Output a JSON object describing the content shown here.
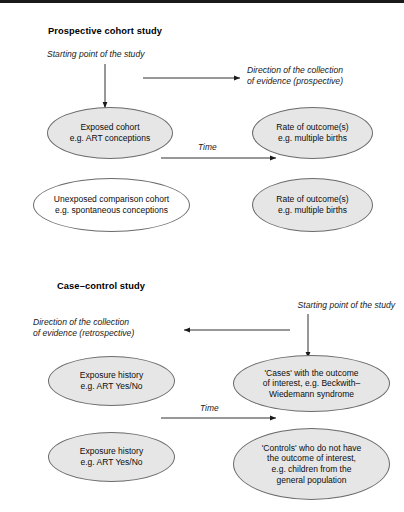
{
  "figure": {
    "panels": [
      {
        "id": "prospective",
        "title": "Prospective cohort study",
        "start_annotation": "Starting point of the study",
        "direction_annotation_line1": "Direction of the collection",
        "direction_annotation_line2": "of evidence (prospective)",
        "time_label": "Time",
        "nodes": [
          {
            "id": "exposed-cohort",
            "shaded": true,
            "lines": [
              "Exposed cohort",
              "e.g. ART conceptions"
            ]
          },
          {
            "id": "outcome-exposed",
            "shaded": true,
            "lines": [
              "Rate of outcome(s)",
              "e.g. multiple births"
            ]
          },
          {
            "id": "unexposed-cohort",
            "shaded": false,
            "lines": [
              "Unexposed comparison cohort",
              "e.g. spontaneous conceptions"
            ]
          },
          {
            "id": "outcome-unexposed",
            "shaded": true,
            "lines": [
              "Rate of outcome(s)",
              "e.g. multiple births"
            ]
          }
        ]
      },
      {
        "id": "case-control",
        "title": "Case–control study",
        "start_annotation": "Starting point of the study",
        "direction_annotation_line1": "Direction of the collection",
        "direction_annotation_line2": "of evidence (retrospective)",
        "time_label": "Time",
        "nodes": [
          {
            "id": "exposure-history-cases",
            "shaded": true,
            "lines": [
              "Exposure history",
              "e.g. ART Yes/No"
            ]
          },
          {
            "id": "cases",
            "shaded": true,
            "lines": [
              "'Cases' with the outcome",
              "of interest, e.g. Beckwith–",
              "Wiedemann syndrome"
            ]
          },
          {
            "id": "exposure-history-controls",
            "shaded": true,
            "lines": [
              "Exposure history",
              "e.g. ART Yes/No"
            ]
          },
          {
            "id": "controls",
            "shaded": true,
            "lines": [
              "'Controls' who do not have",
              "the outcome of interest,",
              "e.g. children from the",
              "general population"
            ]
          }
        ]
      }
    ],
    "colors": {
      "ellipse_fill_shaded": "#e6e6e6",
      "ellipse_fill_plain": "#ffffff",
      "ellipse_stroke": "#6b6b6b",
      "text": "#0d0d0d",
      "arrow": "#1a1a1a",
      "top_rule": "#1a1a1a"
    }
  }
}
